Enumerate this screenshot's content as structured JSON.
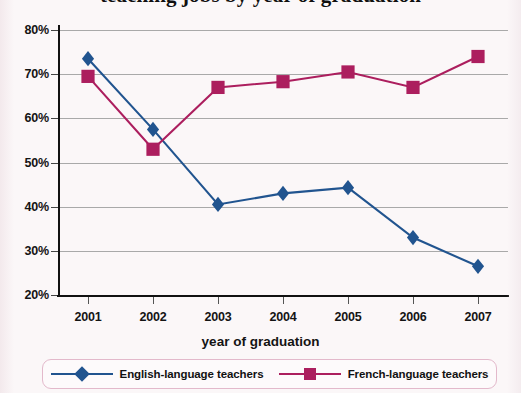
{
  "chart_data": {
    "type": "line",
    "title": "teaching jobs by year of graduation",
    "xlabel": "year of graduation",
    "ylabel": "",
    "categories": [
      "2001",
      "2002",
      "2003",
      "2004",
      "2005",
      "2006",
      "2007"
    ],
    "ylim": [
      20,
      80
    ],
    "ytick_labels": [
      "20%",
      "30%",
      "40%",
      "50%",
      "60%",
      "70%",
      "80%"
    ],
    "ytick_values": [
      20,
      30,
      40,
      50,
      60,
      70,
      80
    ],
    "grid": true,
    "legend_position": "bottom",
    "series": [
      {
        "name": "English-language teachers",
        "marker": "diamond",
        "color": "#21548F",
        "values": [
          73.5,
          57.5,
          40.5,
          43,
          44.3,
          33,
          26.5
        ]
      },
      {
        "name": "French-language teachers",
        "marker": "square",
        "color": "#AC1E5E",
        "values": [
          69.5,
          53,
          67,
          68.3,
          70.5,
          67,
          74
        ]
      }
    ]
  },
  "legend": {
    "items": [
      {
        "label": "English-language teachers",
        "marker": "diamond",
        "color": "#21548F"
      },
      {
        "label": "French-language teachers",
        "marker": "square",
        "color": "#AC1E5E"
      }
    ]
  }
}
